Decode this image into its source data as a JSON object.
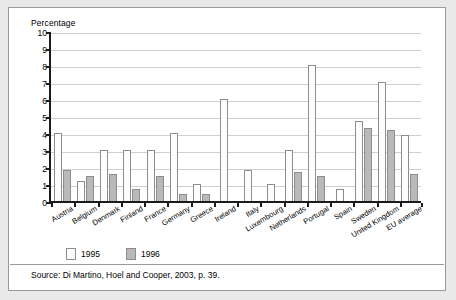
{
  "figure": {
    "axis_title": "Percentage",
    "source": "Source: Di Martino, Hoel and Cooper, 2003, p. 39."
  },
  "legend": {
    "position": "bottom-left",
    "entries": [
      {
        "label": "1995",
        "color": "#fdfdfd"
      },
      {
        "label": "1996",
        "color": "#b9b9b9"
      }
    ]
  },
  "chart_data": {
    "type": "bar",
    "title": "",
    "subtitle": "",
    "xlabel": "",
    "ylabel": "Percentage",
    "ylim": [
      0,
      10
    ],
    "yticks": [
      0,
      1,
      2,
      3,
      4,
      5,
      6,
      7,
      8,
      9,
      10
    ],
    "ytick_labels": [
      "0",
      "1",
      "2",
      "3",
      "4",
      "5",
      "6",
      "7",
      "8",
      "9",
      "10"
    ],
    "grid": true,
    "legend_position": "bottom-left",
    "categories": [
      "Austria",
      "Belgium",
      "Denmark",
      "Finland",
      "France",
      "Germany",
      "Greece",
      "Ireland",
      "Italy",
      "Luxembourg",
      "Netherlands",
      "Portugal",
      "Spain",
      "Sweden",
      "United Kingdom",
      "EU average"
    ],
    "series": [
      {
        "name": "1995",
        "color": "#fdfdfd",
        "values": [
          4.0,
          1.2,
          3.0,
          3.0,
          3.0,
          4.0,
          1.0,
          6.0,
          1.8,
          1.0,
          3.0,
          8.0,
          0.7,
          4.7,
          7.0,
          3.9
        ]
      },
      {
        "name": "1996",
        "color": "#b9b9b9",
        "values": [
          1.8,
          1.5,
          1.6,
          0.7,
          1.5,
          0.4,
          0.4,
          0.0,
          0.0,
          0.0,
          1.7,
          1.5,
          0.0,
          4.3,
          4.2,
          1.6
        ]
      }
    ],
    "annotations": [
      "Source: Di Martino, Hoel and Cooper, 2003, p. 39."
    ]
  }
}
